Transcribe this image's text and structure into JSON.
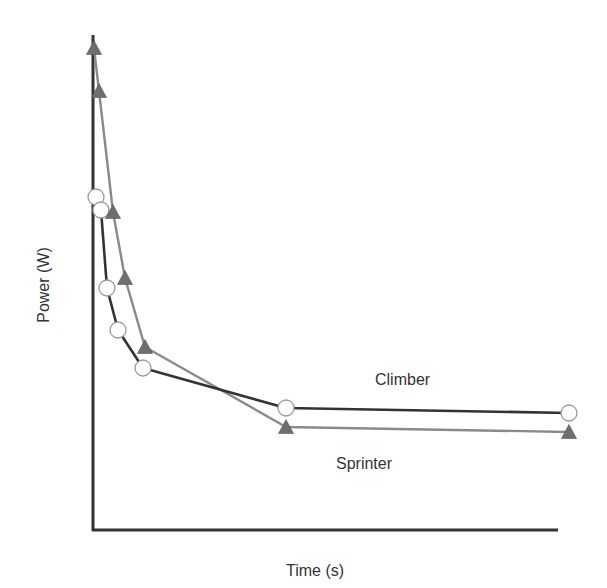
{
  "chart_data": {
    "type": "line",
    "title": "",
    "xlabel": "Time (s)",
    "ylabel": "Power (W)",
    "grid": false,
    "ticks": false,
    "legend": "inline labels",
    "series": [
      {
        "name": "Climber",
        "marker": "circle",
        "line_color": "#333333",
        "marker_fill": "#ffffff",
        "points_px": [
          [
            96,
            197
          ],
          [
            101,
            210
          ],
          [
            107,
            288
          ],
          [
            118,
            330
          ],
          [
            143,
            368
          ],
          [
            286,
            408
          ],
          [
            569,
            413
          ]
        ]
      },
      {
        "name": "Sprinter",
        "marker": "triangle",
        "line_color": "#8a8a8a",
        "marker_fill": "#6e6e6e",
        "points_px": [
          [
            94,
            48
          ],
          [
            99,
            91
          ],
          [
            113,
            212
          ],
          [
            125,
            278
          ],
          [
            145,
            347
          ],
          [
            286,
            427
          ],
          [
            569,
            432
          ]
        ]
      }
    ],
    "annotations": [
      {
        "text": "Climber",
        "x_px": 410,
        "y_px": 381
      },
      {
        "text": "Sprinter",
        "x_px": 371,
        "y_px": 465
      }
    ]
  },
  "axes": {
    "origin_px": [
      93,
      530
    ],
    "y_top_px": 35,
    "x_right_px": 558,
    "color": "#333333"
  },
  "labels": {
    "xlabel": "Time (s)",
    "ylabel": "Power (W)",
    "climber": "Climber",
    "sprinter": "Sprinter"
  }
}
